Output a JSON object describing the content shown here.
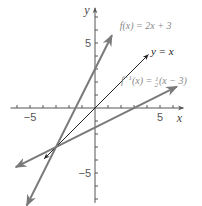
{
  "chart_data": {
    "type": "line",
    "title": "",
    "xlabel": "x",
    "ylabel": "y",
    "xlim": [
      -6.5,
      6.8
    ],
    "ylim": [
      -7.3,
      7.7
    ],
    "x_ticks": [
      -6,
      -5,
      -4,
      -3,
      -2,
      -1,
      1,
      2,
      3,
      4,
      5,
      6
    ],
    "y_ticks": [
      -7,
      -6,
      -5,
      -4,
      -3,
      -2,
      -1,
      1,
      2,
      3,
      4,
      5,
      6,
      7
    ],
    "x_tick_labels": [
      {
        "value": -5,
        "text": "−5"
      },
      {
        "value": 5,
        "text": "5"
      }
    ],
    "y_tick_labels": [
      {
        "value": 5,
        "text": "5"
      },
      {
        "value": -5,
        "text": "−5"
      }
    ],
    "grid": false,
    "series": [
      {
        "name": "f(x) = 2x + 3",
        "label_parts": {
          "main": "f(x) = 2x + 3"
        },
        "slope": 2,
        "intercept": 3,
        "x_range": [
          -5.25,
          1.3
        ],
        "color": "#7a7a7a",
        "arrows": "both",
        "label_anchor": [
          1.9,
          6.1
        ]
      },
      {
        "name": "y = x",
        "label_parts": {
          "main": "y = x"
        },
        "slope": 1,
        "intercept": 0,
        "x_range": [
          -3.9,
          4.1
        ],
        "color": "#222222",
        "arrows": "both",
        "label_anchor": [
          4.3,
          4.3
        ]
      },
      {
        "name": "f⁻¹(x) = ½(x − 3)",
        "label_parts": {
          "f": "f",
          "sup": "−1",
          "mid": "(x) = ",
          "frac_num": "1",
          "frac_den": "2",
          "tail": "(x − 3)"
        },
        "slope": 0.5,
        "intercept": -1.5,
        "x_range": [
          -6.1,
          6.3
        ],
        "color": "#7a7a7a",
        "arrows": "both",
        "label_anchor": [
          2.0,
          2.1
        ]
      }
    ],
    "intersection": {
      "x": -3,
      "y": -3
    }
  }
}
